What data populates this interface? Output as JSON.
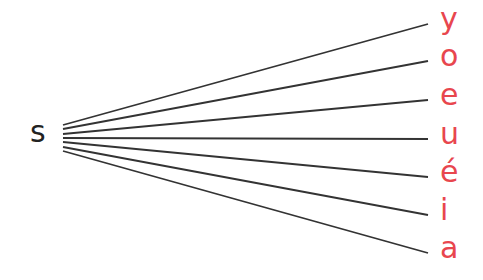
{
  "source": {
    "label": "s",
    "color": "#222222",
    "x": 63
  },
  "line_color": "#333333",
  "target_color": "#e8464e",
  "source_ys": [
    125,
    129,
    134,
    138,
    142,
    147,
    151
  ],
  "targets": [
    {
      "label": "y",
      "y": 24
    },
    {
      "label": "o",
      "y": 61
    },
    {
      "label": "e",
      "y": 100
    },
    {
      "label": "u",
      "y": 139
    },
    {
      "label": "é",
      "y": 177
    },
    {
      "label": "i",
      "y": 215
    },
    {
      "label": "a",
      "y": 253
    }
  ],
  "target_x": 428
}
